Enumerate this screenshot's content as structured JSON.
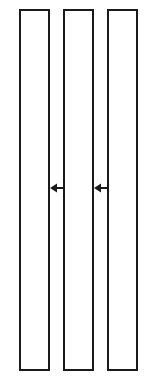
{
  "diagram": {
    "boxes": [
      {
        "id": "left",
        "label": ""
      },
      {
        "id": "middle",
        "label": ""
      },
      {
        "id": "right",
        "label": ""
      }
    ],
    "arrows": [
      {
        "from": "middle",
        "to": "left",
        "direction": "left"
      },
      {
        "from": "right",
        "to": "middle",
        "direction": "left"
      }
    ],
    "colors": {
      "stroke": "#1a1a1a",
      "fill": "#ffffff",
      "background": "#ffffff"
    }
  }
}
